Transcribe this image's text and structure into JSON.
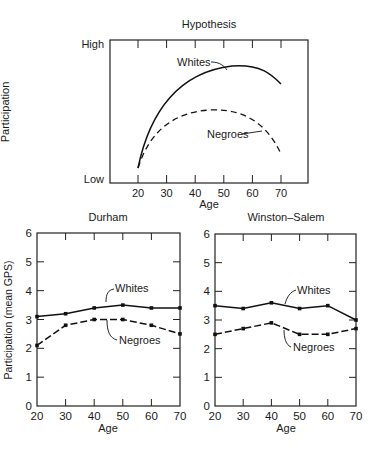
{
  "chart_data": [
    {
      "type": "line",
      "title": "Hypothesis",
      "xlabel": "Age",
      "ylabel": "Participation",
      "x_ticks": [
        20,
        30,
        40,
        50,
        60,
        70
      ],
      "y_tick_labels": [
        "Low",
        "High"
      ],
      "grid": false,
      "legend": "inline annotations",
      "series": [
        {
          "name": "Whites",
          "style": "solid",
          "shape": "concave curve rising from low at 20, peaking near age 53, declining toward 70",
          "x": [
            20,
            25,
            30,
            40,
            50,
            53,
            60,
            70
          ],
          "y": [
            0.05,
            0.45,
            0.62,
            0.8,
            0.86,
            0.865,
            0.84,
            0.72
          ]
        },
        {
          "name": "Negroes",
          "style": "dashed",
          "shape": "concave curve, lower, peaking near age 45, declining toward 70",
          "x": [
            20,
            25,
            30,
            40,
            45,
            50,
            60,
            70
          ],
          "y": [
            0.08,
            0.3,
            0.42,
            0.55,
            0.57,
            0.56,
            0.44,
            0.22
          ]
        }
      ]
    },
    {
      "type": "line",
      "title": "Durham",
      "xlabel": "Age",
      "ylabel": "Participation (mean GPS)",
      "x": [
        20,
        30,
        40,
        50,
        60,
        70
      ],
      "ylim": [
        0,
        6
      ],
      "y_ticks": [
        0,
        1,
        2,
        3,
        4,
        5,
        6
      ],
      "grid": false,
      "series": [
        {
          "name": "Whites",
          "style": "solid",
          "values": [
            3.1,
            3.2,
            3.4,
            3.5,
            3.4,
            3.4
          ]
        },
        {
          "name": "Negroes",
          "style": "dashed",
          "values": [
            2.1,
            2.8,
            3.0,
            3.0,
            2.8,
            2.5
          ]
        }
      ]
    },
    {
      "type": "line",
      "title": "Winston-Salem",
      "xlabel": "Age",
      "ylabel": "",
      "x": [
        20,
        30,
        40,
        50,
        60,
        70
      ],
      "ylim": [
        0,
        6
      ],
      "y_ticks": [
        0,
        1,
        2,
        3,
        4,
        5,
        6
      ],
      "grid": false,
      "series": [
        {
          "name": "Whites",
          "style": "solid",
          "values": [
            3.5,
            3.4,
            3.6,
            3.4,
            3.5,
            3.0
          ]
        },
        {
          "name": "Negroes",
          "style": "dashed",
          "values": [
            2.5,
            2.7,
            2.9,
            2.5,
            2.5,
            2.7
          ]
        }
      ]
    }
  ],
  "labels": {
    "hyp_title": "Hypothesis",
    "hyp_high": "High",
    "hyp_low": "Low",
    "hyp_ylabel": "Participation",
    "hyp_xlabel": "Age",
    "whites": "Whites",
    "negroes": "Negroes",
    "durham_title": "Durham",
    "ws_title": "Winston–Salem",
    "gps_ylabel": "Participation (mean GPS)",
    "age": "Age"
  }
}
